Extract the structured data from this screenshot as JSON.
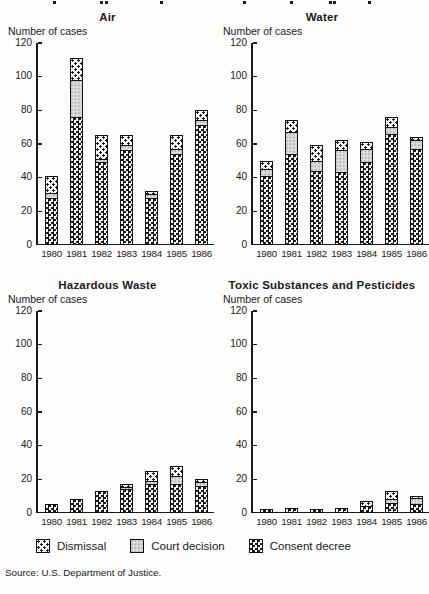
{
  "axis": {
    "label": "Number of cases",
    "y_ticks": [
      0,
      20,
      40,
      60,
      80,
      100,
      120
    ],
    "ylim": [
      0,
      120
    ]
  },
  "legend": [
    {
      "key": "dismissal",
      "label": "Dismissal"
    },
    {
      "key": "court",
      "label": "Court decision"
    },
    {
      "key": "consent",
      "label": "Consent decree"
    }
  ],
  "source": {
    "text": "Source:  U.S. Department of Justice."
  },
  "colors": {
    "ink": "#1a1a1a",
    "paper": "#fdfdfb",
    "court_gray": "#dcdcdc"
  },
  "chart_data": [
    {
      "type": "bar",
      "title": "Air",
      "ylabel": "Number of cases",
      "ylim": [
        0,
        120
      ],
      "stacked": true,
      "categories": [
        "1980",
        "1981",
        "1982",
        "1983",
        "1984",
        "1985",
        "1986"
      ],
      "series": [
        {
          "name": "Consent decree",
          "key": "consent",
          "values": [
            27,
            75,
            48,
            55,
            27,
            53,
            70
          ]
        },
        {
          "name": "Court decision",
          "key": "court",
          "values": [
            3,
            22,
            2,
            3,
            2,
            3,
            3
          ]
        },
        {
          "name": "Dismissal",
          "key": "dismissal",
          "values": [
            10,
            13,
            14,
            6,
            2,
            8,
            6
          ]
        }
      ]
    },
    {
      "type": "bar",
      "title": "Water",
      "ylabel": "Number of cases",
      "ylim": [
        0,
        120
      ],
      "stacked": true,
      "categories": [
        "1980",
        "1981",
        "1982",
        "1983",
        "1984",
        "1985",
        "1986"
      ],
      "series": [
        {
          "name": "Consent decree",
          "key": "consent",
          "values": [
            40,
            53,
            43,
            42,
            48,
            65,
            56
          ]
        },
        {
          "name": "Court decision",
          "key": "court",
          "values": [
            4,
            13,
            6,
            13,
            8,
            4,
            5
          ]
        },
        {
          "name": "Dismissal",
          "key": "dismissal",
          "values": [
            5,
            7,
            9,
            6,
            4,
            6,
            2
          ]
        }
      ]
    },
    {
      "type": "bar",
      "title": "Hazardous Waste",
      "ylabel": "Number of cases",
      "ylim": [
        0,
        120
      ],
      "stacked": true,
      "categories": [
        "1980",
        "1981",
        "1982",
        "1983",
        "1984",
        "1985",
        "1986"
      ],
      "series": [
        {
          "name": "Consent decree",
          "key": "consent",
          "values": [
            4,
            7,
            12,
            13,
            16,
            16,
            15
          ]
        },
        {
          "name": "Court decision",
          "key": "court",
          "values": [
            0,
            0,
            0,
            1,
            2,
            5,
            2
          ]
        },
        {
          "name": "Dismissal",
          "key": "dismissal",
          "values": [
            0,
            0,
            0,
            2,
            6,
            6,
            2
          ]
        }
      ]
    },
    {
      "type": "bar",
      "title": "Toxic Substances and Pesticides",
      "ylabel": "Number of cases",
      "ylim": [
        0,
        120
      ],
      "stacked": true,
      "categories": [
        "1980",
        "1981",
        "1982",
        "1983",
        "1984",
        "1985",
        "1986"
      ],
      "series": [
        {
          "name": "Consent decree",
          "key": "consent",
          "values": [
            1,
            2,
            1,
            2,
            3,
            5,
            4
          ]
        },
        {
          "name": "Court decision",
          "key": "court",
          "values": [
            0,
            0,
            0,
            0,
            0,
            2,
            4
          ]
        },
        {
          "name": "Dismissal",
          "key": "dismissal",
          "values": [
            0,
            0,
            0,
            0,
            3,
            5,
            1
          ]
        }
      ]
    }
  ]
}
